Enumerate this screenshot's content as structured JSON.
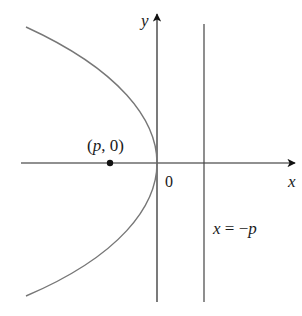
{
  "diagram": {
    "type": "parabola",
    "labels": {
      "y_axis": "y",
      "x_axis": "x",
      "origin": "0",
      "focus": "(p, 0)",
      "focus_p": "p",
      "focus_rest": ", 0)",
      "focus_open": "(",
      "directrix": "x = −p",
      "directrix_x": "x",
      "directrix_eq": " = −",
      "directrix_p": "p"
    },
    "colors": {
      "axes": "#222222",
      "curve": "#777777",
      "point": "#111111",
      "directrix": "#444444"
    }
  }
}
